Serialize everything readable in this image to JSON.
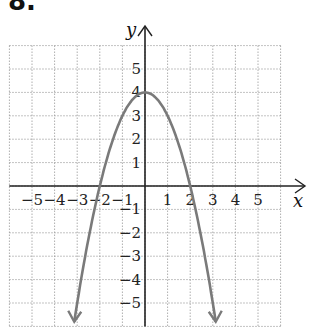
{
  "problem_label": "8.",
  "chart_data": {
    "type": "line",
    "title": "",
    "xlabel": "x",
    "ylabel": "y",
    "xlim": [
      -6,
      6
    ],
    "ylim": [
      -6,
      6
    ],
    "grid": true,
    "x_ticks": [
      "−5",
      "−4",
      "−3",
      "−2",
      "−1",
      "1",
      "2",
      "3",
      "4",
      "5"
    ],
    "y_ticks": [
      "5",
      "4",
      "3",
      "2",
      "1",
      "−1",
      "−2",
      "−3",
      "−4",
      "−5"
    ],
    "series": [
      {
        "name": "y = -x^2 + 4",
        "equation": "y = -x^2 + 4",
        "vertex": [
          0,
          4
        ],
        "x_intercepts": [
          -2,
          2
        ],
        "color": "#7a7a7a",
        "arrows_both_ends": true
      }
    ]
  }
}
